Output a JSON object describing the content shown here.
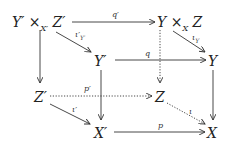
{
  "diagram": {
    "type": "commutative-cube",
    "nodes": {
      "pullback_top": "Y′ ×X′ Z′",
      "pullback_top_parts": {
        "a": "Y′ ×",
        "sub": "X′",
        "b": " Z′"
      },
      "fiber_product": "Y ×X Z",
      "fiber_product_parts": {
        "a": "Y ×",
        "sub": "X",
        "b": " Z"
      },
      "Yprime": "Y′",
      "Y": "Y",
      "Zprime": "Z′",
      "Z": "Z",
      "Xprime": "X′",
      "X": "X"
    },
    "arrows": {
      "q_prime": "q′",
      "iota_prime_Yprime": "ι′Y′",
      "q": "q",
      "iota_Y": "ιY",
      "p_prime": "p′",
      "iota_prime": "ι′",
      "iota": "ι",
      "p": "p"
    },
    "edges": [
      {
        "from": "pullback_top",
        "to": "fiber_product",
        "label": "q′",
        "style": "solid"
      },
      {
        "from": "pullback_top",
        "to": "Yprime",
        "label": "ι′Y′",
        "style": "solid"
      },
      {
        "from": "pullback_top",
        "to": "Zprime",
        "label": "",
        "style": "solid"
      },
      {
        "from": "fiber_product",
        "to": "Y",
        "label": "ιY",
        "style": "solid"
      },
      {
        "from": "fiber_product",
        "to": "Z",
        "label": "",
        "style": "dotted"
      },
      {
        "from": "Yprime",
        "to": "Y",
        "label": "q",
        "style": "solid"
      },
      {
        "from": "Yprime",
        "to": "Xprime",
        "label": "",
        "style": "solid"
      },
      {
        "from": "Y",
        "to": "X",
        "label": "",
        "style": "solid"
      },
      {
        "from": "Zprime",
        "to": "Z",
        "label": "p′",
        "style": "dotted"
      },
      {
        "from": "Zprime",
        "to": "Xprime",
        "label": "ι′",
        "style": "solid"
      },
      {
        "from": "Z",
        "to": "X",
        "label": "ι",
        "style": "dotted"
      },
      {
        "from": "Xprime",
        "to": "X",
        "label": "p",
        "style": "solid"
      }
    ]
  }
}
